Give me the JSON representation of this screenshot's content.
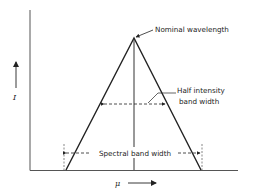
{
  "diagram": {
    "type": "spectral-band-triangle",
    "labels": {
      "nominal_wavelength": "Nominal wavelength",
      "half_intensity_line1": "Half intensity",
      "half_intensity_line2": "band width",
      "spectral_band_width": "Spectral band width",
      "x_axis_symbol": "μ",
      "y_axis_symbol": "I"
    },
    "colors": {
      "line": "#222222",
      "axis": "#444444",
      "background": "#ffffff"
    }
  }
}
